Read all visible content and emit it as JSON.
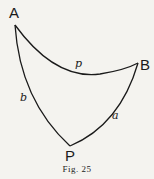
{
  "figure": {
    "caption": "Fig. 25",
    "vertices": [
      {
        "id": "A",
        "label": "A"
      },
      {
        "id": "B",
        "label": "B"
      },
      {
        "id": "P",
        "label": "P"
      }
    ],
    "sides": [
      {
        "id": "p",
        "label": "p",
        "from": "A",
        "to": "B"
      },
      {
        "id": "b",
        "label": "b",
        "from": "A",
        "to": "P"
      },
      {
        "id": "a",
        "label": "a",
        "from": "B",
        "to": "P"
      }
    ],
    "stroke_color": "#1a1a1a",
    "background_color": "#f4f3ef"
  }
}
